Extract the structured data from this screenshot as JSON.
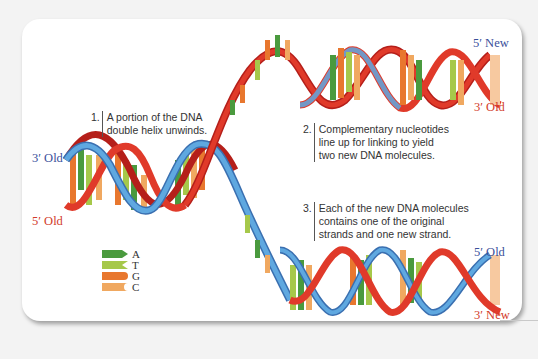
{
  "diagram": {
    "strand_labels": {
      "left_top": "3′ Old",
      "left_bottom": "5′ Old",
      "upper_right_top": "5′ New",
      "upper_right_bottom": "3′ Old",
      "lower_right_top": "5′ Old",
      "lower_right_bottom": "3′ New"
    },
    "steps": [
      {
        "num": "1.",
        "lines": [
          "A portion of the DNA",
          "double helix unwinds."
        ]
      },
      {
        "num": "2.",
        "lines": [
          "Complementary nucleotides",
          "line up for linking to yield",
          "two new DNA molecules."
        ]
      },
      {
        "num": "3.",
        "lines": [
          "Each of the new DNA molecules",
          "contains one of the original",
          "strands and one new strand."
        ]
      }
    ],
    "legend": [
      {
        "base": "A",
        "color": "#4a9a3e",
        "shape": "arrow-right"
      },
      {
        "base": "T",
        "color": "#a6c84a",
        "shape": "notch-left"
      },
      {
        "base": "G",
        "color": "#e8772e",
        "shape": "round-right"
      },
      {
        "base": "C",
        "color": "#f0a860",
        "shape": "cup-right"
      }
    ],
    "colors": {
      "old_strand_blue": "#5fa8e0",
      "old_strand_blue_dark": "#3a6fb0",
      "strand_red": "#e03a2a",
      "strand_red_dark": "#b51f1a",
      "label_blue": "#3a4f9a",
      "label_red": "#d23a2a"
    }
  }
}
